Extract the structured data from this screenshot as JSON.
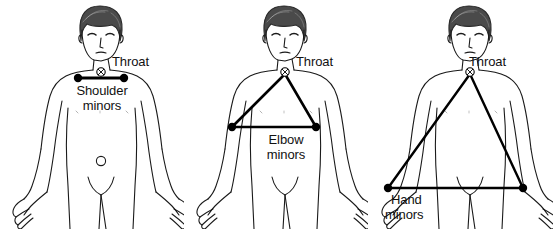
{
  "diagram": {
    "background_color": "#ffffff",
    "line_color": "#000000",
    "body_outline_color": "#1a1a1a",
    "text_color": "#111111",
    "panels": [
      {
        "id": "shoulder-minors",
        "throat_label": "Throat",
        "point_label_line1": "Shoulder",
        "point_label_line2": "minors",
        "connection": "horizontal line between the two shoulder points",
        "points": [
          "throat",
          "left shoulder",
          "right shoulder"
        ]
      },
      {
        "id": "elbow-minors",
        "throat_label": "Throat",
        "point_label_line1": "Elbow",
        "point_label_line2": "minors",
        "connection": "triangle from throat to both elbows",
        "points": [
          "throat",
          "left elbow",
          "right elbow"
        ]
      },
      {
        "id": "hand-minors",
        "throat_label": "Throat",
        "point_label_line1": "Hand",
        "point_label_line2": "minors",
        "connection": "triangle from throat to both hands",
        "points": [
          "throat",
          "left hand",
          "right hand"
        ]
      }
    ]
  }
}
